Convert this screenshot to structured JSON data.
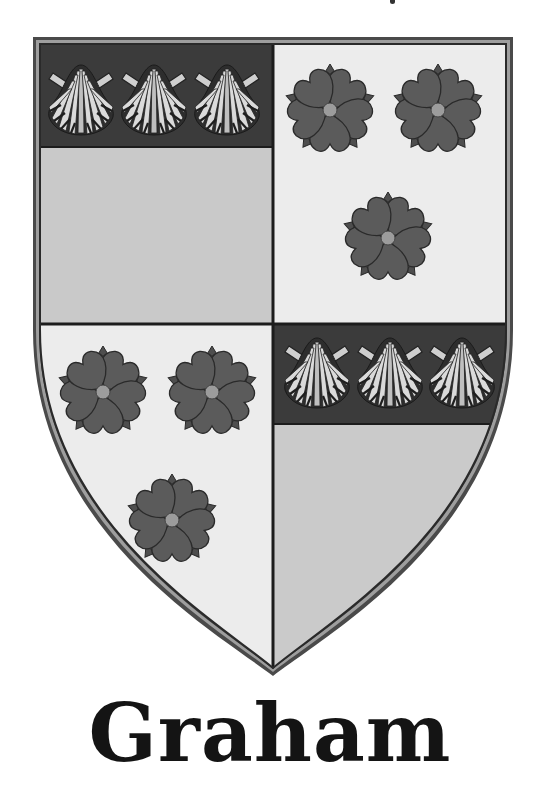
{
  "coat_of_arms": {
    "surname": "Graham",
    "colors": {
      "border_outer": "#4a4a4a",
      "border_inner": "#9a9a9a",
      "field_gray": "#c9c9c9",
      "field_light": "#ececec",
      "band_dark": "#3b3b3b",
      "rose": "#575757",
      "rose_center": "#9c9c9c",
      "shell": "#d8d8d8",
      "divider": "#1c1c1c"
    },
    "quadrants": [
      {
        "position": "top-left",
        "chief_charges": "3 escallops",
        "field": "gray"
      },
      {
        "position": "top-right",
        "charges": "3 roses",
        "field": "light"
      },
      {
        "position": "bottom-left",
        "charges": "3 roses",
        "field": "light"
      },
      {
        "position": "bottom-right",
        "chief_charges": "3 escallops",
        "field": "gray"
      }
    ],
    "charges": {
      "shells": [
        {
          "x": 81,
          "y": 99
        },
        {
          "x": 154,
          "y": 99
        },
        {
          "x": 227,
          "y": 99
        },
        {
          "x": 317,
          "y": 372
        },
        {
          "x": 390,
          "y": 372
        },
        {
          "x": 462,
          "y": 372
        }
      ],
      "roses": [
        {
          "x": 330,
          "y": 110
        },
        {
          "x": 438,
          "y": 110
        },
        {
          "x": 388,
          "y": 238
        },
        {
          "x": 103,
          "y": 392
        },
        {
          "x": 212,
          "y": 392
        },
        {
          "x": 172,
          "y": 520
        }
      ]
    }
  }
}
